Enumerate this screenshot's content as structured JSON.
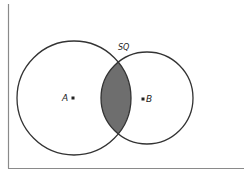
{
  "diagram": {
    "type": "venn",
    "labels": {
      "a": "A",
      "b": "B",
      "intersection_point": "SQ"
    },
    "colors": {
      "stroke": "#333333",
      "frame": "#888888",
      "shade": "#6e6e6e",
      "marker": "#222222"
    },
    "circles": [
      {
        "name": "A",
        "cx": 74,
        "cy": 98,
        "r": 57
      },
      {
        "name": "B",
        "cx": 147,
        "cy": 98,
        "r": 46
      }
    ],
    "shaded_region": "intersection of A and B"
  }
}
